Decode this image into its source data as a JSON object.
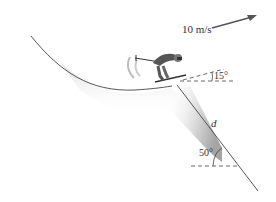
{
  "diagram": {
    "type": "physics-ski-jump",
    "velocity_label": "10 m/s",
    "launch_angle_label": "15°",
    "slope_angle_label": "50°",
    "distance_label": "d",
    "colors": {
      "line": "#333333",
      "arrow": "#555555",
      "shadow": "#bdbdbd",
      "skier": "#444444"
    }
  }
}
